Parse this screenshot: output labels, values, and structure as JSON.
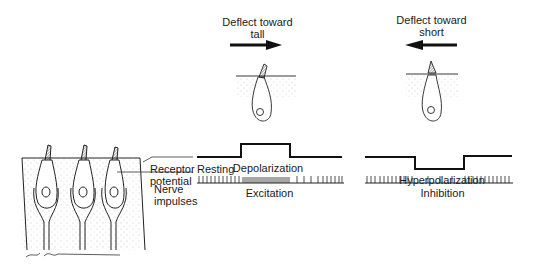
{
  "left_panel": {
    "receptor_label_1": "Receptor",
    "receptor_label_2": "potential",
    "nerve_label_1": "Nerve",
    "nerve_label_2": "impulses",
    "resting_label": "Resting",
    "signature": "H.L. Dunn"
  },
  "excitation_panel": {
    "direction_line_1": "Deflect toward",
    "direction_line_2": "tall",
    "arrow_direction": "right",
    "potential_label": "Depolarization",
    "impulse_label": "Excitation"
  },
  "inhibition_panel": {
    "direction_line_1": "Deflect toward",
    "direction_line_2": "short",
    "arrow_direction": "left",
    "potential_label": "Hyperpolarization",
    "impulse_label": "Inhibition"
  },
  "colors": {
    "ink": "#1a1a1a",
    "background": "#ffffff"
  }
}
